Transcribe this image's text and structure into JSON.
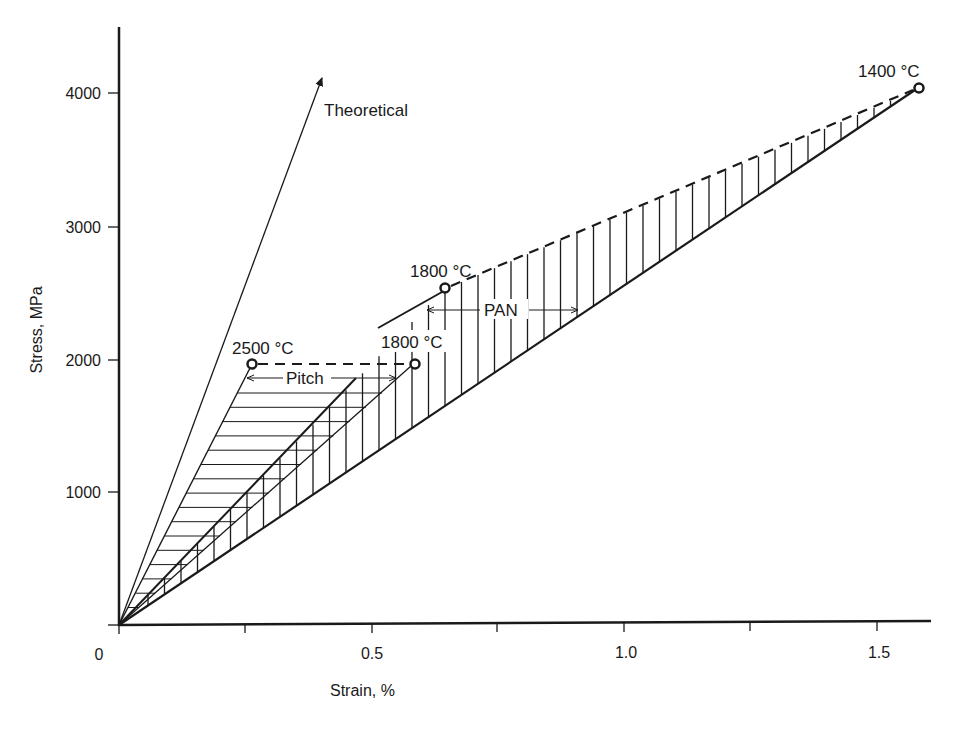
{
  "chart_data": {
    "type": "line",
    "title": "",
    "xlabel": "Strain, %",
    "ylabel": "Stress, MPa",
    "xlim": [
      0,
      1.6
    ],
    "ylim": [
      0,
      4500
    ],
    "grid": false,
    "legend": "none (inline annotations)",
    "x_ticks": [
      0,
      0.25,
      0.5,
      0.75,
      1.0,
      1.25,
      1.5
    ],
    "x_tick_labels": [
      "0",
      "",
      "0.5",
      "",
      "1.0",
      "",
      "1.5"
    ],
    "y_ticks": [
      0,
      1000,
      2000,
      3000,
      4000
    ],
    "y_tick_labels": [
      "",
      "1000",
      "2000",
      "3000",
      "4000"
    ],
    "series": [
      {
        "name": "Theoretical",
        "style": "solid arrow",
        "points": [
          [
            0,
            0
          ],
          [
            0.405,
            4100
          ]
        ]
      },
      {
        "name": "Pitch 2500 °C",
        "style": "solid",
        "points": [
          [
            0,
            0
          ],
          [
            0.265,
            1970
          ]
        ],
        "end_marker": "open circle"
      },
      {
        "name": "Pitch 1800 °C",
        "style": "solid thin",
        "points": [
          [
            0,
            0
          ],
          [
            0.585,
            1970
          ]
        ],
        "end_marker": "open circle"
      },
      {
        "name": "PAN 1800 °C",
        "style": "solid thick",
        "points": [
          [
            0,
            0
          ],
          [
            0.645,
            2540
          ]
        ],
        "end_marker": "open circle"
      },
      {
        "name": "PAN 1400 °C",
        "style": "solid thick",
        "points": [
          [
            0,
            0
          ],
          [
            1.58,
            4050
          ]
        ],
        "end_marker": "open circle"
      },
      {
        "name": "Pitch range",
        "style": "dashed",
        "points": [
          [
            0.265,
            1970
          ],
          [
            0.585,
            1970
          ]
        ]
      },
      {
        "name": "PAN range",
        "style": "dashed",
        "points": [
          [
            0.645,
            2540
          ],
          [
            1.58,
            4050
          ]
        ]
      }
    ],
    "annotations": [
      {
        "text": "Theoretical",
        "x": 0.41,
        "y": 3900
      },
      {
        "text": "1400 °C",
        "x": 1.5,
        "y": 4150
      },
      {
        "text": "1800 °C",
        "x": 0.58,
        "y": 2600
      },
      {
        "text": "2500 °C",
        "x": 0.22,
        "y": 2060
      },
      {
        "text": "1800 °C",
        "x": 0.52,
        "y": 2060
      },
      {
        "text": "PAN",
        "x": 0.77,
        "y": 2370,
        "range_arrow": [
          0.6,
          0.91
        ]
      },
      {
        "text": "Pitch",
        "x": 0.37,
        "y": 1870,
        "range_arrow": [
          0.255,
          0.55
        ]
      }
    ],
    "shaded_regions": [
      {
        "name": "Pitch",
        "hatch": "horizontal",
        "bounds": "between Pitch 2500 °C and Pitch 1800 °C lines"
      },
      {
        "name": "PAN",
        "hatch": "vertical",
        "bounds": "between PAN 1400 °C line and PAN 1800 °C line / PAN dashed range"
      }
    ]
  },
  "labels": {
    "xlabel": "Strain, %",
    "ylabel": "Stress, MPa",
    "x0": "0",
    "x05": "0.5",
    "x10": "1.0",
    "x15": "1.5",
    "y1000": "1000",
    "y2000": "2000",
    "y3000": "3000",
    "y4000": "4000",
    "theoretical": "Theoretical",
    "t1400": "1400 °C",
    "t1800pan": "1800 °C",
    "t2500": "2500 °C",
    "t1800pitch": "1800 °C",
    "pan": "PAN",
    "pitch": "Pitch"
  },
  "colors": {
    "ink": "#1a1a1a",
    "background": "#ffffff"
  }
}
